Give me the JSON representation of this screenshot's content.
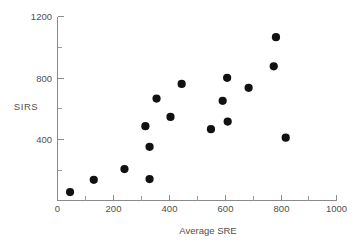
{
  "chart_data": {
    "type": "scatter",
    "title": "",
    "subtitle": "",
    "xlabel": "Average SRE",
    "ylabel": "SIRS",
    "xlim": [
      0,
      1000
    ],
    "ylim": [
      0,
      1200
    ],
    "xticks": [
      0,
      200,
      400,
      600,
      800,
      1000
    ],
    "xtick_labels": [
      "0",
      "200",
      "400",
      "600",
      "800",
      "1000"
    ],
    "yticks": [
      0,
      400,
      800,
      1200
    ],
    "ytick_labels": [
      "0",
      "400",
      "800",
      "1200"
    ],
    "y_minor_ticks": [
      200,
      600,
      1000
    ],
    "x_minor_ticks": [
      100,
      300,
      500,
      700,
      900
    ],
    "grid": false,
    "legend": null,
    "annotations": [],
    "marker": {
      "shape": "circle",
      "color": "#111111",
      "size_px": 4.1
    },
    "points": [
      {
        "x": 45,
        "y": 55
      },
      {
        "x": 130,
        "y": 135
      },
      {
        "x": 240,
        "y": 205
      },
      {
        "x": 315,
        "y": 485
      },
      {
        "x": 330,
        "y": 350
      },
      {
        "x": 330,
        "y": 140
      },
      {
        "x": 355,
        "y": 665
      },
      {
        "x": 405,
        "y": 545
      },
      {
        "x": 445,
        "y": 760
      },
      {
        "x": 550,
        "y": 465
      },
      {
        "x": 592,
        "y": 650
      },
      {
        "x": 608,
        "y": 800
      },
      {
        "x": 610,
        "y": 515
      },
      {
        "x": 685,
        "y": 735
      },
      {
        "x": 775,
        "y": 875
      },
      {
        "x": 783,
        "y": 1065
      },
      {
        "x": 818,
        "y": 410
      }
    ]
  },
  "axes": {
    "x_axis_label": "Average SRE",
    "y_axis_label": "SIRS"
  }
}
